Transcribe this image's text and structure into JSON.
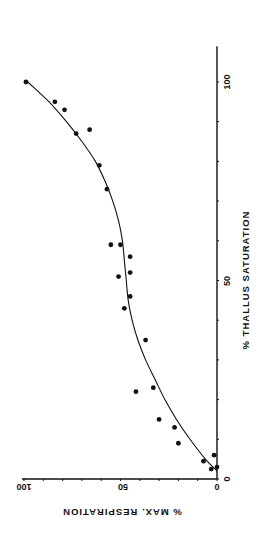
{
  "chart_data": {
    "type": "scatter",
    "orientation": "rotated 90 degrees (x-axis drawn vertically on right, y-axis drawn horizontally at bottom, text rotated)",
    "title": "",
    "xlabel": "% THALLUS SATURATION",
    "ylabel": "% MAX. RESPIRATION",
    "xlim": [
      0,
      100
    ],
    "ylim": [
      0,
      100
    ],
    "x_ticks": [
      0,
      50,
      100
    ],
    "x_minor_ticks": [
      10,
      20,
      30,
      40,
      60,
      70,
      80,
      90
    ],
    "y_ticks": [
      0,
      50,
      100
    ],
    "y_minor_ticks": [
      10,
      20,
      30,
      40,
      60,
      70,
      80,
      90
    ],
    "grid": false,
    "legend": null,
    "series": [
      {
        "name": "observations",
        "marker": "filled-circle",
        "points": [
          {
            "x": 100,
            "y": 99
          },
          {
            "x": 95,
            "y": 84
          },
          {
            "x": 93,
            "y": 79
          },
          {
            "x": 87,
            "y": 73
          },
          {
            "x": 88,
            "y": 66
          },
          {
            "x": 79,
            "y": 61
          },
          {
            "x": 73,
            "y": 57
          },
          {
            "x": 59,
            "y": 55
          },
          {
            "x": 59,
            "y": 50
          },
          {
            "x": 56,
            "y": 45
          },
          {
            "x": 52,
            "y": 45
          },
          {
            "x": 51,
            "y": 51
          },
          {
            "x": 46,
            "y": 45
          },
          {
            "x": 43,
            "y": 48
          },
          {
            "x": 35,
            "y": 37
          },
          {
            "x": 23,
            "y": 33
          },
          {
            "x": 22,
            "y": 42
          },
          {
            "x": 15,
            "y": 30
          },
          {
            "x": 13,
            "y": 22
          },
          {
            "x": 9,
            "y": 20
          },
          {
            "x": 4.5,
            "y": 7
          },
          {
            "x": 2.5,
            "y": 3
          },
          {
            "x": 6,
            "y": 1.5
          },
          {
            "x": 3,
            "y": 0
          }
        ]
      },
      {
        "name": "fitted curve",
        "type": "line",
        "points": [
          {
            "x": 2,
            "y": 0
          },
          {
            "x": 5,
            "y": 6
          },
          {
            "x": 10,
            "y": 14
          },
          {
            "x": 15,
            "y": 21
          },
          {
            "x": 20,
            "y": 27
          },
          {
            "x": 25,
            "y": 32
          },
          {
            "x": 30,
            "y": 37
          },
          {
            "x": 35,
            "y": 41
          },
          {
            "x": 40,
            "y": 44
          },
          {
            "x": 45,
            "y": 46
          },
          {
            "x": 50,
            "y": 47
          },
          {
            "x": 55,
            "y": 48
          },
          {
            "x": 60,
            "y": 49
          },
          {
            "x": 65,
            "y": 51
          },
          {
            "x": 70,
            "y": 54
          },
          {
            "x": 75,
            "y": 58
          },
          {
            "x": 80,
            "y": 63
          },
          {
            "x": 85,
            "y": 70
          },
          {
            "x": 90,
            "y": 78
          },
          {
            "x": 95,
            "y": 87
          },
          {
            "x": 100,
            "y": 98
          }
        ]
      }
    ]
  },
  "labels": {
    "x_tick_0": "0",
    "x_tick_50": "50",
    "x_tick_100": "100",
    "y_tick_0": "0",
    "y_tick_50": "50",
    "y_tick_100": "100",
    "x_axis_label": "% THALLUS SATURATION",
    "y_axis_label": "% MAX. RESPIRATION"
  }
}
